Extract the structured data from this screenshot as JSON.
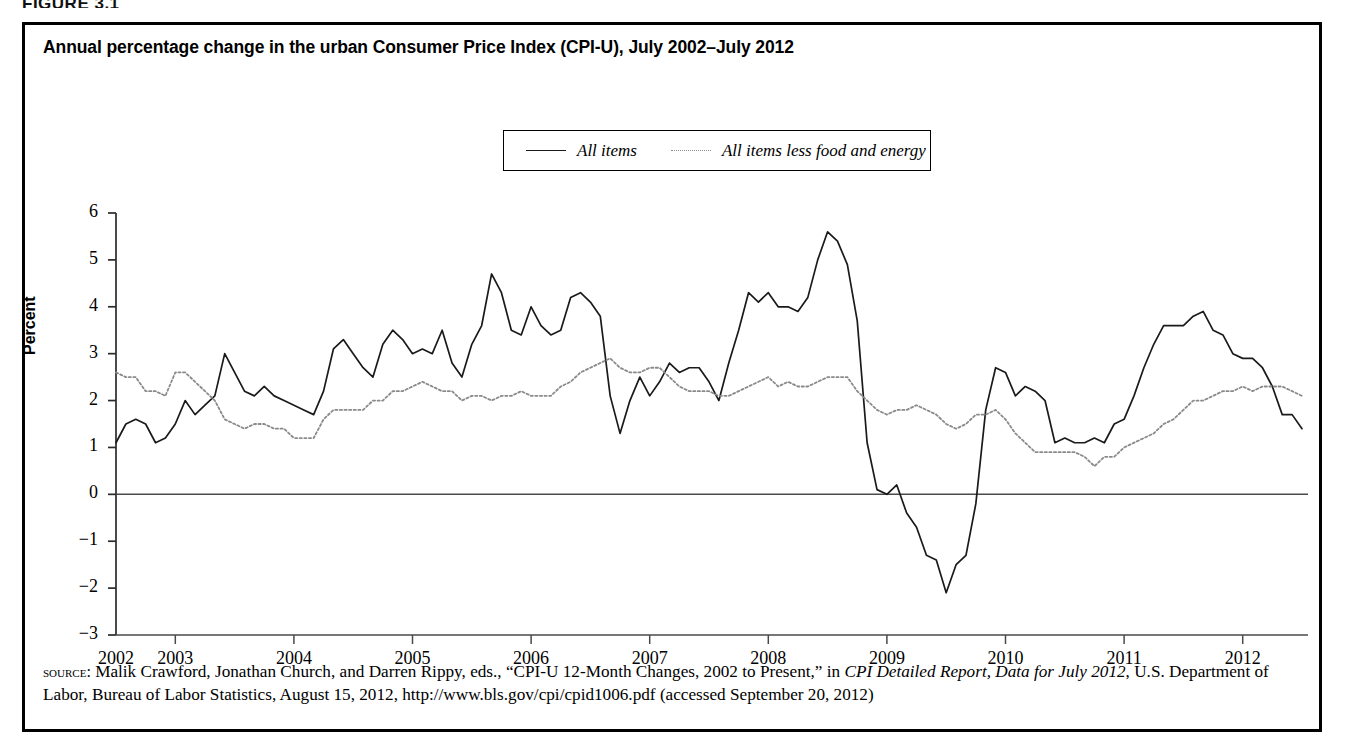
{
  "figure_label": "FIGURE 3.1",
  "chart": {
    "title": "Annual percentage change in the urban Consumer Price Index (CPI-U), July 2002–July 2012",
    "ylabel": "Percent",
    "legend": [
      {
        "label": "All items",
        "style": "solid",
        "color": "#1a1a1a"
      },
      {
        "label": "All items less food and energy",
        "style": "dotted",
        "color": "#8a8a8a"
      }
    ],
    "ytick_labels": [
      "6",
      "5",
      "4",
      "3",
      "2",
      "1",
      "0",
      "−1",
      "−2",
      "−3"
    ],
    "xtick_labels": [
      "2002",
      "2003",
      "2004",
      "2005",
      "2006",
      "2007",
      "2008",
      "2009",
      "2010",
      "2011",
      "2012"
    ]
  },
  "source_note": {
    "kicker": "source:",
    "text_1": " Malik Crawford, Jonathan Church, and Darren Rippy, eds., “CPI-U 12-Month Changes, 2002 to Present,” in ",
    "italic_1": "CPI Detailed Report, Data for July 2012",
    "text_2": ", U.S. Department of Labor, Bureau of Labor Statistics, August 15, 2012, http://www.bls.gov/cpi/cpid1006.pdf (accessed September 20, 2012)"
  },
  "chart_data": {
    "type": "line",
    "title": "Annual percentage change in the urban Consumer Price Index (CPI-U), July 2002–July 2012",
    "xlabel": "",
    "ylabel": "Percent",
    "ylim": [
      -3,
      6
    ],
    "xlim": [
      "2002-07",
      "2012-07"
    ],
    "grid": false,
    "legend_position": "top-center",
    "xtick_values": [
      "2002",
      "2003",
      "2004",
      "2005",
      "2006",
      "2007",
      "2008",
      "2009",
      "2010",
      "2011",
      "2012"
    ],
    "ytick_values": [
      6,
      5,
      4,
      3,
      2,
      1,
      0,
      -1,
      -2,
      -3
    ],
    "x": [
      "2002-07",
      "2002-08",
      "2002-09",
      "2002-10",
      "2002-11",
      "2002-12",
      "2003-01",
      "2003-02",
      "2003-03",
      "2003-04",
      "2003-05",
      "2003-06",
      "2003-07",
      "2003-08",
      "2003-09",
      "2003-10",
      "2003-11",
      "2003-12",
      "2004-01",
      "2004-02",
      "2004-03",
      "2004-04",
      "2004-05",
      "2004-06",
      "2004-07",
      "2004-08",
      "2004-09",
      "2004-10",
      "2004-11",
      "2004-12",
      "2005-01",
      "2005-02",
      "2005-03",
      "2005-04",
      "2005-05",
      "2005-06",
      "2005-07",
      "2005-08",
      "2005-09",
      "2005-10",
      "2005-11",
      "2005-12",
      "2006-01",
      "2006-02",
      "2006-03",
      "2006-04",
      "2006-05",
      "2006-06",
      "2006-07",
      "2006-08",
      "2006-09",
      "2006-10",
      "2006-11",
      "2006-12",
      "2007-01",
      "2007-02",
      "2007-03",
      "2007-04",
      "2007-05",
      "2007-06",
      "2007-07",
      "2007-08",
      "2007-09",
      "2007-10",
      "2007-11",
      "2007-12",
      "2008-01",
      "2008-02",
      "2008-03",
      "2008-04",
      "2008-05",
      "2008-06",
      "2008-07",
      "2008-08",
      "2008-09",
      "2008-10",
      "2008-11",
      "2008-12",
      "2009-01",
      "2009-02",
      "2009-03",
      "2009-04",
      "2009-05",
      "2009-06",
      "2009-07",
      "2009-08",
      "2009-09",
      "2009-10",
      "2009-11",
      "2009-12",
      "2010-01",
      "2010-02",
      "2010-03",
      "2010-04",
      "2010-05",
      "2010-06",
      "2010-07",
      "2010-08",
      "2010-09",
      "2010-10",
      "2010-11",
      "2010-12",
      "2011-01",
      "2011-02",
      "2011-03",
      "2011-04",
      "2011-05",
      "2011-06",
      "2011-07",
      "2011-08",
      "2011-09",
      "2011-10",
      "2011-11",
      "2011-12",
      "2012-01",
      "2012-02",
      "2012-03",
      "2012-04",
      "2012-05",
      "2012-06",
      "2012-07"
    ],
    "series": [
      {
        "name": "All items",
        "style": "solid",
        "color": "#1a1a1a",
        "values": [
          1.1,
          1.5,
          1.6,
          1.5,
          1.1,
          1.2,
          1.5,
          2.0,
          1.7,
          1.9,
          2.1,
          3.0,
          2.6,
          2.2,
          2.1,
          2.3,
          2.1,
          2.0,
          1.9,
          1.8,
          1.7,
          2.2,
          3.1,
          3.3,
          3.0,
          2.7,
          2.5,
          3.2,
          3.5,
          3.3,
          3.0,
          3.1,
          3.0,
          3.5,
          2.8,
          2.5,
          3.2,
          3.6,
          4.7,
          4.3,
          3.5,
          3.4,
          4.0,
          3.6,
          3.4,
          3.5,
          4.2,
          4.3,
          4.1,
          3.8,
          2.1,
          1.3,
          2.0,
          2.5,
          2.1,
          2.4,
          2.8,
          2.6,
          2.7,
          2.7,
          2.4,
          2.0,
          2.8,
          3.5,
          4.3,
          4.1,
          4.3,
          4.0,
          4.0,
          3.9,
          4.2,
          5.0,
          5.6,
          5.4,
          4.9,
          3.7,
          1.1,
          0.1,
          0.0,
          0.2,
          -0.4,
          -0.7,
          -1.3,
          -1.4,
          -2.1,
          -1.5,
          -1.3,
          -0.2,
          1.8,
          2.7,
          2.6,
          2.1,
          2.3,
          2.2,
          2.0,
          1.1,
          1.2,
          1.1,
          1.1,
          1.2,
          1.1,
          1.5,
          1.6,
          2.1,
          2.7,
          3.2,
          3.6,
          3.6,
          3.6,
          3.8,
          3.9,
          3.5,
          3.4,
          3.0,
          2.9,
          2.9,
          2.7,
          2.3,
          1.7,
          1.7,
          1.4
        ]
      },
      {
        "name": "All items less food and energy",
        "style": "dotted",
        "color": "#8a8a8a",
        "values": [
          2.6,
          2.5,
          2.5,
          2.2,
          2.2,
          2.1,
          2.6,
          2.6,
          2.4,
          2.2,
          2.0,
          1.6,
          1.5,
          1.4,
          1.5,
          1.5,
          1.4,
          1.4,
          1.2,
          1.2,
          1.2,
          1.6,
          1.8,
          1.8,
          1.8,
          1.8,
          2.0,
          2.0,
          2.2,
          2.2,
          2.3,
          2.4,
          2.3,
          2.2,
          2.2,
          2.0,
          2.1,
          2.1,
          2.0,
          2.1,
          2.1,
          2.2,
          2.1,
          2.1,
          2.1,
          2.3,
          2.4,
          2.6,
          2.7,
          2.8,
          2.9,
          2.7,
          2.6,
          2.6,
          2.7,
          2.7,
          2.5,
          2.3,
          2.2,
          2.2,
          2.2,
          2.1,
          2.1,
          2.2,
          2.3,
          2.4,
          2.5,
          2.3,
          2.4,
          2.3,
          2.3,
          2.4,
          2.5,
          2.5,
          2.5,
          2.2,
          2.0,
          1.8,
          1.7,
          1.8,
          1.8,
          1.9,
          1.8,
          1.7,
          1.5,
          1.4,
          1.5,
          1.7,
          1.7,
          1.8,
          1.6,
          1.3,
          1.1,
          0.9,
          0.9,
          0.9,
          0.9,
          0.9,
          0.8,
          0.6,
          0.8,
          0.8,
          1.0,
          1.1,
          1.2,
          1.3,
          1.5,
          1.6,
          1.8,
          2.0,
          2.0,
          2.1,
          2.2,
          2.2,
          2.3,
          2.2,
          2.3,
          2.3,
          2.3,
          2.2,
          2.1
        ]
      }
    ]
  }
}
